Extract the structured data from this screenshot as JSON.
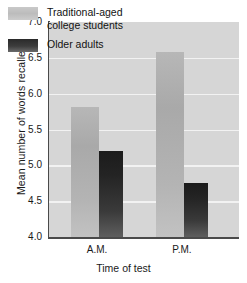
{
  "chart_data": {
    "type": "bar",
    "title": "",
    "subtitle": "",
    "categories": [
      "A.M.",
      "P.M."
    ],
    "series": [
      {
        "name": "Traditional-aged\ncollege students",
        "legend_label": "Traditional-aged college students",
        "color": "#b0b0b0",
        "values": [
          5.82,
          6.58
        ]
      },
      {
        "name": "Older adults",
        "legend_label": "Older adults",
        "color": "#2b2b2b",
        "values": [
          5.2,
          4.75
        ]
      }
    ],
    "xlabel": "Time of test",
    "ylabel": "Mean number of words recalled",
    "ylim": [
      4.0,
      7.0
    ],
    "ytick_values": [
      4.0,
      4.5,
      5.0,
      5.5,
      6.0,
      6.5,
      7.0
    ],
    "ytick_labels": [
      "4.0",
      "4.5",
      "5.0",
      "5.5",
      "6.0",
      "6.5",
      "7.0"
    ],
    "grid": "horizontal",
    "gridline_color": "#f2f2f2",
    "plot_background": "#d6d6d6",
    "legend_position": "upper-left-inside"
  }
}
